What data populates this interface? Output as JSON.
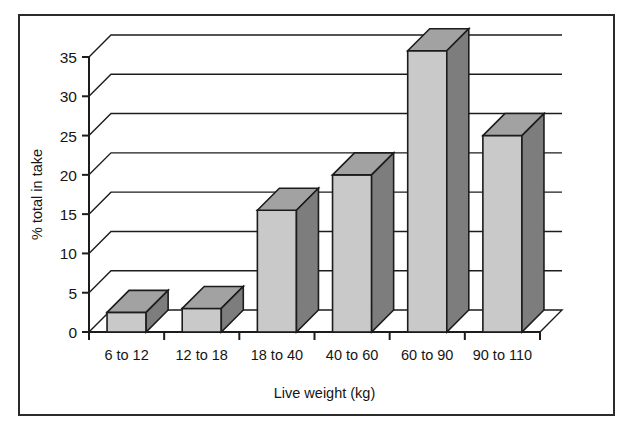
{
  "figure": {
    "background_color": "#ffffff",
    "frame_color": "#2b2b2b"
  },
  "chart_data": {
    "type": "bar",
    "style": "3d-column",
    "title": "",
    "subtitle": "",
    "xlabel": "Live weight (kg)",
    "ylabel": "% total in take",
    "categories": [
      "6 to 12",
      "12 to 18",
      "18 to 40",
      "40 to 60",
      "60 to 90",
      "90 to 110"
    ],
    "values": [
      2.5,
      3,
      15.5,
      20,
      35.8,
      25
    ],
    "ylim": [
      0,
      35
    ],
    "yticks": [
      0,
      5,
      10,
      15,
      20,
      25,
      30,
      35
    ],
    "ytick_labels": [
      "0",
      "5",
      "10",
      "15",
      "20",
      "25",
      "30",
      "35"
    ],
    "grid": true,
    "legend": false,
    "legend_position": "none",
    "colors": {
      "bar_front": "#c9c9c9",
      "bar_top": "#a2a2a2",
      "bar_side": "#7d7d7d",
      "bar_outline": "#1c1c1c",
      "gridline": "#1c1c1c",
      "axis": "#1c1c1c"
    }
  }
}
